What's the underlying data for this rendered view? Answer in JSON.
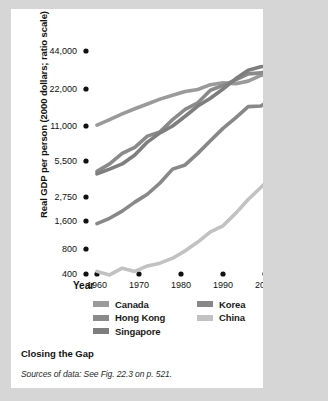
{
  "figure": {
    "caption_title": "Closing the Gap",
    "caption_source": "Sources of data: See Fig. 22.3 on p. 521."
  },
  "chart_data": {
    "type": "line",
    "title": "Closing the Gap",
    "xlabel": "Year",
    "ylabel": "Real GDP per person (2000 dollars; ratio scale)",
    "scale": "log",
    "grid": false,
    "legend_position": "bottom",
    "xlim": [
      1960,
      2012
    ],
    "ylim": [
      400,
      50000
    ],
    "xticks": [
      1960,
      1970,
      1980,
      1990,
      2000,
      2010
    ],
    "xtick_labels": [
      "1960",
      "1970",
      "1980",
      "1990",
      "2000",
      "2010"
    ],
    "yticks": [
      400,
      800,
      1600,
      2750,
      5500,
      11000,
      22000,
      44000
    ],
    "ytick_labels": [
      "400",
      "800",
      "1,600",
      "2,750",
      "5,500",
      "11,000",
      "22,000",
      "44,000"
    ],
    "colors": {
      "canada": "#9a9a9a",
      "hong_kong": "#8a8a8a",
      "singapore": "#7e7e7e",
      "korea": "#888888",
      "china": "#c2c2c2",
      "axis": "#111111",
      "background": "#ffffff",
      "page": "#d6d6d6"
    },
    "series": [
      {
        "name": "Canada",
        "color": "#9a9a9a",
        "x": [
          1960,
          1963,
          1966,
          1969,
          1972,
          1975,
          1978,
          1981,
          1984,
          1987,
          1990,
          1993,
          1996,
          1999,
          2002,
          2005,
          2008,
          2011
        ],
        "values": [
          11200,
          12400,
          13800,
          15200,
          16600,
          18200,
          19600,
          21000,
          21800,
          23800,
          24600,
          24200,
          25400,
          28200,
          30000,
          32400,
          34000,
          34600
        ]
      },
      {
        "name": "Hong Kong",
        "color": "#8a8a8a",
        "x": [
          1960,
          1963,
          1966,
          1969,
          1972,
          1975,
          1978,
          1981,
          1984,
          1987,
          1990,
          1993,
          1996,
          1999,
          2002,
          2005,
          2008,
          2011
        ],
        "values": [
          4500,
          5200,
          6400,
          7200,
          9000,
          9800,
          12400,
          15000,
          17000,
          21500,
          23500,
          26000,
          29000,
          29500,
          31500,
          35000,
          39000,
          42500
        ]
      },
      {
        "name": "Singapore",
        "color": "#7e7e7e",
        "x": [
          1960,
          1963,
          1966,
          1969,
          1972,
          1975,
          1978,
          1981,
          1984,
          1987,
          1990,
          1993,
          1996,
          1999,
          2002,
          2005,
          2008,
          2011
        ],
        "values": [
          4300,
          4700,
          5200,
          6200,
          8000,
          9600,
          11000,
          13200,
          16000,
          18500,
          22000,
          26500,
          31000,
          33000,
          34000,
          37000,
          41000,
          44500
        ]
      },
      {
        "name": "Korea",
        "color": "#888888",
        "x": [
          1960,
          1963,
          1966,
          1969,
          1972,
          1975,
          1978,
          1981,
          1984,
          1987,
          1990,
          1993,
          1996,
          1999,
          2002,
          2005,
          2008,
          2011
        ],
        "values": [
          1500,
          1700,
          2000,
          2450,
          2900,
          3600,
          4700,
          5100,
          6400,
          8200,
          10500,
          12800,
          15800,
          16000,
          18500,
          20500,
          22500,
          23000
        ]
      },
      {
        "name": "China",
        "color": "#c2c2c2",
        "x": [
          1960,
          1963,
          1966,
          1969,
          1972,
          1975,
          1978,
          1981,
          1984,
          1987,
          1990,
          1993,
          1996,
          1999,
          2002,
          2005,
          2008,
          2011
        ],
        "values": [
          430,
          390,
          470,
          430,
          500,
          540,
          620,
          760,
          950,
          1220,
          1420,
          1900,
          2600,
          3300,
          4200,
          5600,
          8200,
          11000
        ]
      }
    ]
  },
  "axis": {
    "x_title": "Year"
  },
  "legend": {
    "left_column": [
      {
        "label": "Canada",
        "color": "#9a9a9a"
      },
      {
        "label": "Hong Kong",
        "color": "#8a8a8a"
      },
      {
        "label": "Singapore",
        "color": "#7e7e7e"
      }
    ],
    "right_column": [
      {
        "label": "Korea",
        "color": "#888888"
      },
      {
        "label": "China",
        "color": "#c2c2c2"
      }
    ]
  }
}
